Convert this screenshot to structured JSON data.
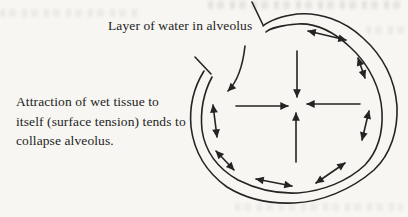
{
  "page": {
    "background_color": "#f7f6f2",
    "ink_color": "#242424"
  },
  "labels": {
    "water_layer": "Layer of water in alveolus",
    "caption_lines": [
      "Attraction of wet tissue to",
      "itself (surface tension) tends to",
      "collapse alveolus."
    ]
  },
  "diagram": {
    "collapse_arrow_count": 4,
    "surface_tension_arrow_count": 7
  }
}
